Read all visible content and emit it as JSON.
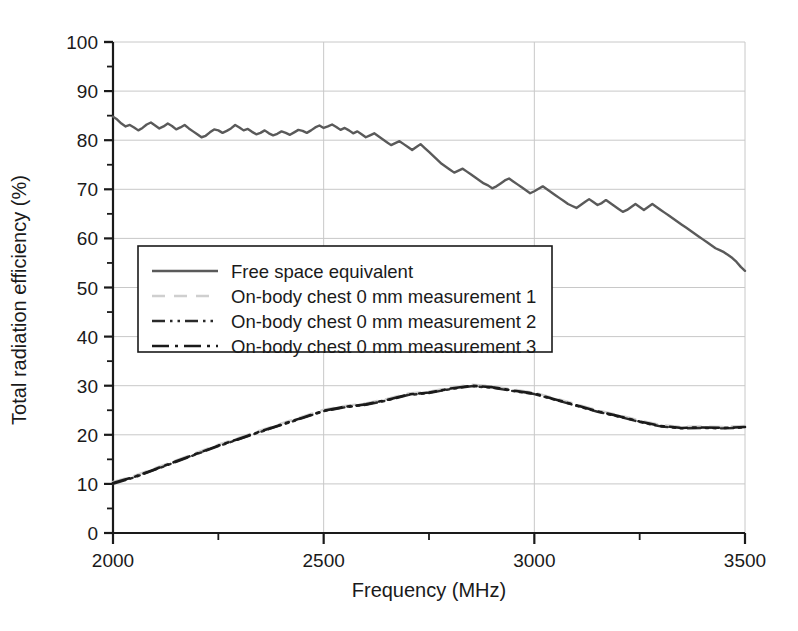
{
  "chart_data": {
    "type": "line",
    "title": "",
    "xlabel": "Frequency (MHz)",
    "ylabel": "Total radiation efficiency (%)",
    "xlim": [
      2000,
      3500
    ],
    "ylim": [
      0,
      100
    ],
    "xticks": [
      2000,
      2500,
      3000,
      3500
    ],
    "xtick_labels": [
      "2000",
      "2500",
      "3000",
      "3500"
    ],
    "xminor_ticks": [
      2250,
      2750,
      3250
    ],
    "yticks": [
      0,
      10,
      20,
      30,
      40,
      50,
      60,
      70,
      80,
      90,
      100
    ],
    "ytick_labels": [
      "0",
      "10",
      "20",
      "30",
      "40",
      "50",
      "60",
      "70",
      "80",
      "90",
      "100"
    ],
    "yminor_ticks": [
      5,
      15,
      25,
      35,
      45,
      55,
      65,
      75,
      85,
      95
    ],
    "grid": true,
    "grid_color": "#c8c8c8",
    "legend_position": "center-left",
    "series": [
      {
        "name": "Free space equivalent",
        "style": "solid",
        "color": "#5a5a5a",
        "width": 2.4,
        "x": [
          2000,
          2010,
          2020,
          2030,
          2040,
          2050,
          2060,
          2070,
          2080,
          2090,
          2100,
          2110,
          2120,
          2130,
          2140,
          2150,
          2160,
          2170,
          2180,
          2190,
          2200,
          2210,
          2220,
          2230,
          2240,
          2250,
          2260,
          2270,
          2280,
          2290,
          2300,
          2310,
          2320,
          2330,
          2340,
          2350,
          2360,
          2370,
          2380,
          2390,
          2400,
          2410,
          2420,
          2430,
          2440,
          2450,
          2460,
          2470,
          2480,
          2490,
          2500,
          2510,
          2520,
          2530,
          2540,
          2550,
          2560,
          2570,
          2580,
          2590,
          2600,
          2610,
          2620,
          2630,
          2640,
          2650,
          2660,
          2670,
          2680,
          2690,
          2700,
          2710,
          2720,
          2730,
          2740,
          2750,
          2760,
          2770,
          2780,
          2790,
          2800,
          2810,
          2820,
          2830,
          2840,
          2850,
          2860,
          2870,
          2880,
          2890,
          2900,
          2910,
          2920,
          2930,
          2940,
          2950,
          2960,
          2970,
          2980,
          2990,
          3000,
          3010,
          3020,
          3030,
          3040,
          3050,
          3060,
          3070,
          3080,
          3090,
          3100,
          3110,
          3120,
          3130,
          3140,
          3150,
          3160,
          3170,
          3180,
          3190,
          3200,
          3210,
          3220,
          3230,
          3240,
          3250,
          3260,
          3270,
          3280,
          3290,
          3300,
          3310,
          3320,
          3330,
          3340,
          3350,
          3360,
          3370,
          3380,
          3390,
          3400,
          3410,
          3420,
          3430,
          3440,
          3450,
          3460,
          3470,
          3480,
          3490,
          3500
        ],
        "y": [
          84.8,
          84.2,
          83.4,
          82.8,
          83.1,
          82.6,
          82.0,
          82.5,
          83.2,
          83.6,
          83.0,
          82.4,
          82.8,
          83.4,
          82.9,
          82.2,
          82.6,
          83.1,
          82.4,
          81.8,
          81.2,
          80.6,
          80.9,
          81.6,
          82.2,
          82.0,
          81.5,
          81.9,
          82.4,
          83.1,
          82.6,
          82.0,
          82.3,
          81.7,
          81.2,
          81.5,
          82.0,
          81.4,
          81.0,
          81.3,
          81.8,
          81.5,
          81.1,
          81.6,
          82.1,
          81.9,
          81.5,
          82.0,
          82.6,
          83.0,
          82.5,
          82.8,
          83.2,
          82.7,
          82.1,
          82.5,
          82.0,
          81.4,
          81.8,
          81.2,
          80.6,
          81.0,
          81.4,
          80.8,
          80.2,
          79.6,
          79.0,
          79.4,
          79.8,
          79.2,
          78.6,
          78.0,
          78.6,
          79.2,
          78.4,
          77.6,
          76.8,
          76.0,
          75.2,
          74.6,
          74.0,
          73.4,
          73.8,
          74.2,
          73.6,
          73.0,
          72.4,
          71.8,
          71.2,
          70.8,
          70.2,
          70.6,
          71.2,
          71.8,
          72.2,
          71.6,
          71.0,
          70.4,
          69.8,
          69.2,
          69.6,
          70.1,
          70.6,
          70.0,
          69.4,
          68.8,
          68.2,
          67.6,
          67.0,
          66.6,
          66.2,
          66.8,
          67.4,
          68.0,
          67.4,
          66.8,
          67.2,
          67.8,
          67.2,
          66.6,
          66.0,
          65.4,
          65.8,
          66.4,
          67.0,
          66.4,
          65.8,
          66.4,
          67.0,
          66.4,
          65.8,
          65.2,
          64.6,
          64.0,
          63.4,
          62.8,
          62.2,
          61.6,
          61.0,
          60.4,
          59.8,
          59.2,
          58.6,
          58.0,
          57.6,
          57.2,
          56.6,
          56.0,
          55.2,
          54.2,
          53.4
        ]
      },
      {
        "name": "On-body chest 0 mm measurement 1",
        "style": "dashed",
        "color": "#cfcfcf",
        "width": 2.4,
        "x": [
          2000,
          2050,
          2100,
          2150,
          2200,
          2250,
          2300,
          2350,
          2400,
          2450,
          2500,
          2550,
          2600,
          2650,
          2700,
          2750,
          2800,
          2850,
          2900,
          2950,
          3000,
          3050,
          3100,
          3150,
          3200,
          3250,
          3300,
          3350,
          3400,
          3450,
          3500
        ],
        "y": [
          10.4,
          11.6,
          13.2,
          14.8,
          16.4,
          18.0,
          19.4,
          20.9,
          22.3,
          23.7,
          25.1,
          25.9,
          26.4,
          27.3,
          28.4,
          28.8,
          29.6,
          30.2,
          29.9,
          29.2,
          28.6,
          27.4,
          26.2,
          25.0,
          24.0,
          22.9,
          22.0,
          21.6,
          21.7,
          21.6,
          21.8
        ]
      },
      {
        "name": "On-body chest 0 mm measurement 2",
        "style": "dashdotdot",
        "color": "#2a2a2a",
        "width": 2.4,
        "x": [
          2000,
          2050,
          2100,
          2150,
          2200,
          2250,
          2300,
          2350,
          2400,
          2450,
          2500,
          2550,
          2600,
          2650,
          2700,
          2750,
          2800,
          2850,
          2900,
          2950,
          3000,
          3050,
          3100,
          3150,
          3200,
          3250,
          3300,
          3350,
          3400,
          3450,
          3500
        ],
        "y": [
          10.0,
          11.3,
          12.9,
          14.5,
          16.1,
          17.7,
          19.1,
          20.6,
          22.0,
          23.4,
          24.8,
          25.6,
          26.1,
          27.0,
          28.1,
          28.5,
          29.3,
          29.9,
          29.6,
          28.9,
          28.3,
          27.1,
          25.9,
          24.7,
          23.7,
          22.6,
          21.7,
          21.3,
          21.4,
          21.3,
          21.5
        ]
      },
      {
        "name": "On-body chest 0 mm measurement 3",
        "style": "dashdot",
        "color": "#1a1a1a",
        "width": 2.6,
        "x": [
          2000,
          2050,
          2100,
          2150,
          2200,
          2250,
          2300,
          2350,
          2400,
          2450,
          2500,
          2550,
          2600,
          2650,
          2700,
          2750,
          2800,
          2850,
          2900,
          2950,
          3000,
          3050,
          3100,
          3150,
          3200,
          3250,
          3300,
          3350,
          3400,
          3450,
          3500
        ],
        "y": [
          10.2,
          11.4,
          13.0,
          14.6,
          16.2,
          17.8,
          19.2,
          20.7,
          22.1,
          23.5,
          24.9,
          25.7,
          26.2,
          27.1,
          28.2,
          28.6,
          29.4,
          30.0,
          29.7,
          29.0,
          28.4,
          27.2,
          26.0,
          24.8,
          23.8,
          22.7,
          21.8,
          21.4,
          21.5,
          21.4,
          21.6
        ]
      }
    ]
  },
  "legend": {
    "items": [
      "Free space equivalent",
      "On-body chest 0 mm measurement 1",
      "On-body chest 0 mm measurement 2",
      "On-body chest 0 mm measurement 3"
    ]
  }
}
